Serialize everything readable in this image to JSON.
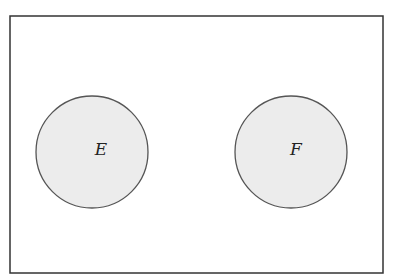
{
  "diagram": {
    "type": "venn",
    "universe": {
      "x": 10,
      "y": 16,
      "width": 373,
      "height": 257,
      "stroke": "#333333"
    },
    "sets": [
      {
        "label": "E",
        "cx": 92,
        "cy": 152,
        "r": 56,
        "fill": "#ececec",
        "stroke": "#555555"
      },
      {
        "label": "F",
        "cx": 291,
        "cy": 152,
        "r": 56,
        "fill": "#ececec",
        "stroke": "#555555"
      }
    ],
    "relationship": "disjoint"
  }
}
